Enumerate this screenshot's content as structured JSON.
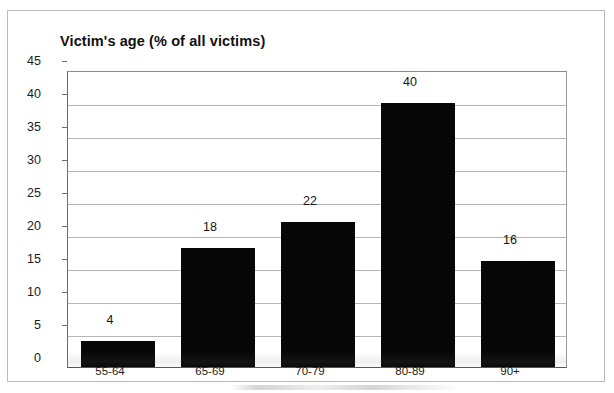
{
  "chart_data": {
    "type": "bar",
    "title": "Victim's age (% of all victims)",
    "xlabel": "",
    "ylabel": "",
    "categories": [
      "55-64",
      "65-69",
      "70-79",
      "80-89",
      "90+"
    ],
    "values": [
      4,
      18,
      22,
      40,
      16
    ],
    "data_labels": [
      "4",
      "18",
      "22",
      "40",
      "16"
    ],
    "ylim": [
      0,
      45
    ],
    "ytick_step": 5,
    "yticks": [
      "45",
      "40",
      "35",
      "30",
      "25",
      "20",
      "15",
      "10",
      "5",
      "0"
    ],
    "ytick_values": [
      45,
      40,
      35,
      30,
      25,
      20,
      15,
      10,
      5,
      0
    ],
    "grid": "horizontal",
    "legend": "none",
    "bar_color": "#060606",
    "gridline_color": "#b5b5b5",
    "axis_color": "#555555",
    "background_color": "#ffffff"
  },
  "figure": {
    "frame_label": "figure-border",
    "smudge_label": "scan-artifact"
  }
}
